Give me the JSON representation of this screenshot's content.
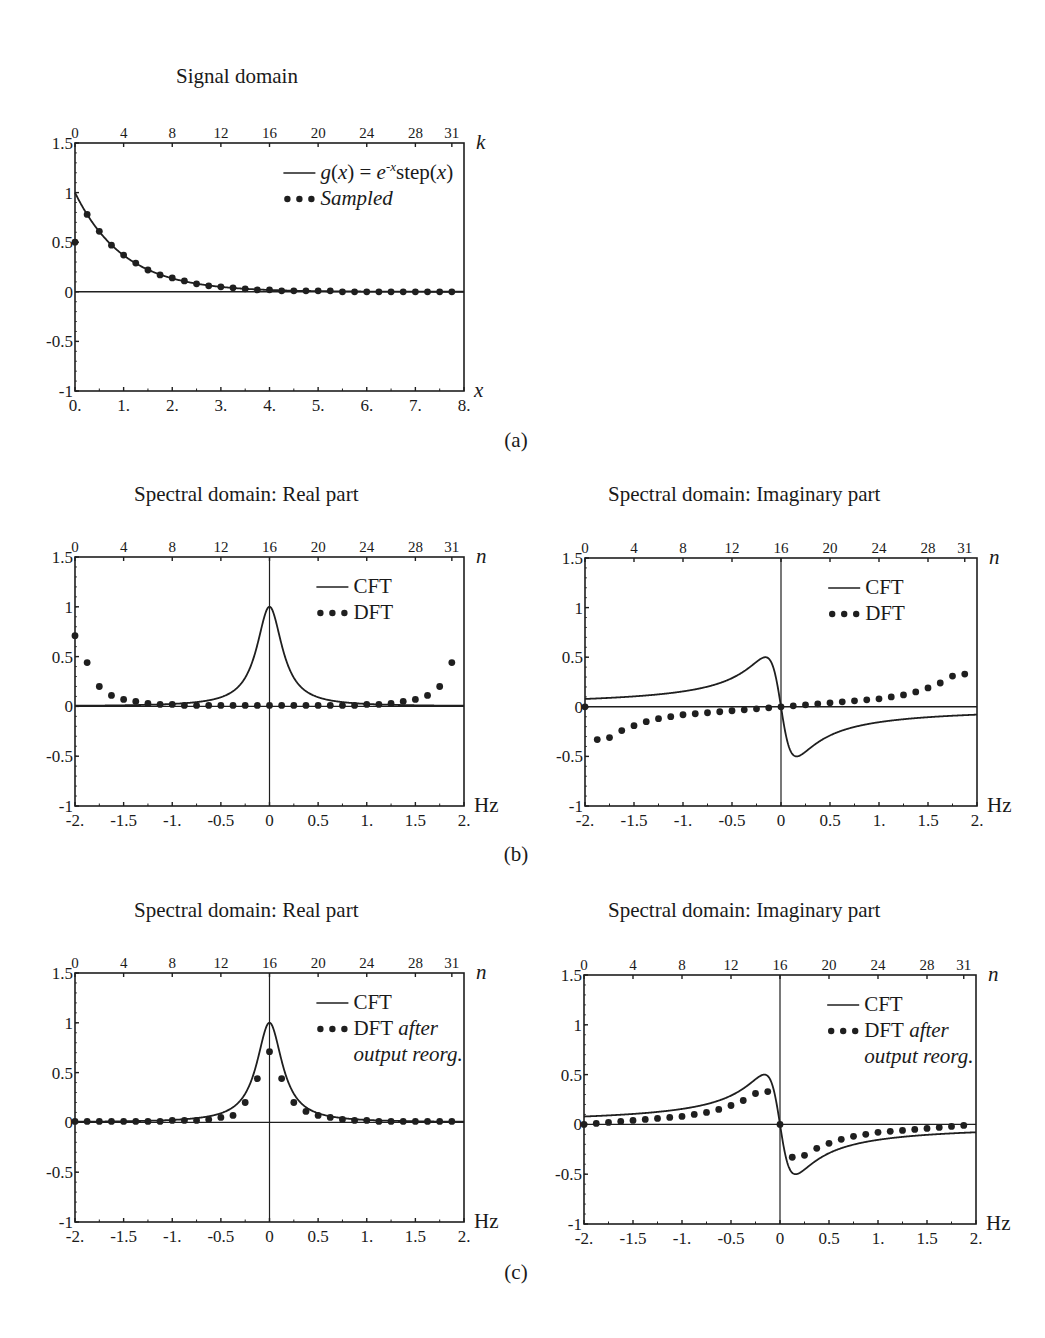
{
  "figure": {
    "panel_labels": {
      "a": "(a)",
      "b": "(b)",
      "c": "(c)"
    }
  },
  "plots": [
    {
      "id": "signal",
      "title": "Signal domain",
      "left": 75,
      "top": 143,
      "width": 389,
      "height": 248,
      "xrange": [
        0,
        8
      ],
      "yrange": [
        -1,
        1.5
      ],
      "bottom_ticks": [
        "0.",
        "1.",
        "2.",
        "3.",
        "4.",
        "5.",
        "6.",
        "7.",
        "8."
      ],
      "bottom_tick_values": [
        0,
        1,
        2,
        3,
        4,
        5,
        6,
        7,
        8
      ],
      "top_ticks": [
        "0",
        "4",
        "8",
        "12",
        "16",
        "20",
        "24",
        "28",
        "31"
      ],
      "top_tick_index": [
        0,
        4,
        8,
        12,
        16,
        20,
        24,
        28,
        31
      ],
      "top_index_to_x": {
        "offset": 0,
        "step": 0.25
      },
      "y_ticks": [
        "1.5",
        "1",
        "0.5",
        "0",
        "-0.5",
        "-1"
      ],
      "y_tick_values": [
        1.5,
        1,
        0.5,
        0,
        -0.5,
        -1
      ],
      "x_axis_label": "x",
      "top_axis_label": "k",
      "center_vline": false,
      "legend": {
        "line": "g(x) = e^{-x} step(x)",
        "line_text": "g(x) = e",
        "line_sup": "-x",
        "line_text2": "step(x)",
        "dots": "Sampled",
        "dots_italic": true,
        "dots_extra": ""
      },
      "curve": "exp"
    },
    {
      "id": "real-b",
      "title": "Spectral domain: Real part",
      "left": 75,
      "top": 557,
      "width": 389,
      "height": 249,
      "xrange": [
        -2,
        2
      ],
      "yrange": [
        -1,
        1.5
      ],
      "bottom_ticks": [
        "-2.",
        "-1.5",
        "-1.",
        "-0.5",
        "0",
        "0.5",
        "1.",
        "1.5",
        "2."
      ],
      "bottom_tick_values": [
        -2,
        -1.5,
        -1,
        -0.5,
        0,
        0.5,
        1,
        1.5,
        2
      ],
      "top_ticks": [
        "0",
        "4",
        "8",
        "12",
        "16",
        "20",
        "24",
        "28",
        "31"
      ],
      "top_tick_index": [
        0,
        4,
        8,
        12,
        16,
        20,
        24,
        28,
        31
      ],
      "top_index_to_x": {
        "offset": -2,
        "step": 0.125
      },
      "y_ticks": [
        "1.5",
        "1",
        "0.5",
        "0",
        "-0.5",
        "-1"
      ],
      "y_tick_values": [
        1.5,
        1,
        0.5,
        0,
        -0.5,
        -1
      ],
      "x_axis_label": "Hz",
      "top_axis_label": "n",
      "center_vline": true,
      "legend": {
        "line_text": "CFT",
        "line_sup": "",
        "line_text2": "",
        "dots": "DFT",
        "dots_italic": false,
        "dots_extra": ""
      },
      "curve": "re"
    },
    {
      "id": "imag-b",
      "title": "Spectral domain: Imaginary part",
      "left": 585,
      "top": 558,
      "width": 392,
      "height": 248,
      "xrange": [
        -2,
        2
      ],
      "yrange": [
        -1,
        1.5
      ],
      "bottom_ticks": [
        "-2.",
        "-1.5",
        "-1.",
        "-0.5",
        "0",
        "0.5",
        "1.",
        "1.5",
        "2."
      ],
      "bottom_tick_values": [
        -2,
        -1.5,
        -1,
        -0.5,
        0,
        0.5,
        1,
        1.5,
        2
      ],
      "top_ticks": [
        "0",
        "4",
        "8",
        "12",
        "16",
        "20",
        "24",
        "28",
        "31"
      ],
      "top_tick_index": [
        0,
        4,
        8,
        12,
        16,
        20,
        24,
        28,
        31
      ],
      "top_index_to_x": {
        "offset": -2,
        "step": 0.125
      },
      "y_ticks": [
        "1.5",
        "1",
        "0.5",
        "0",
        "-0.5",
        "-1"
      ],
      "y_tick_values": [
        1.5,
        1,
        0.5,
        0,
        -0.5,
        -1
      ],
      "x_axis_label": "Hz",
      "top_axis_label": "n",
      "center_vline": true,
      "legend": {
        "line_text": "CFT",
        "line_sup": "",
        "line_text2": "",
        "dots": "DFT",
        "dots_italic": false,
        "dots_extra": ""
      },
      "curve": "im"
    },
    {
      "id": "real-c",
      "title": "Spectral domain: Real part",
      "left": 75,
      "top": 973,
      "width": 389,
      "height": 249,
      "xrange": [
        -2,
        2
      ],
      "yrange": [
        -1,
        1.5
      ],
      "bottom_ticks": [
        "-2.",
        "-1.5",
        "-1.",
        "-0.5",
        "0",
        "0.5",
        "1.",
        "1.5",
        "2."
      ],
      "bottom_tick_values": [
        -2,
        -1.5,
        -1,
        -0.5,
        0,
        0.5,
        1,
        1.5,
        2
      ],
      "top_ticks": [
        "0",
        "4",
        "8",
        "12",
        "16",
        "20",
        "24",
        "28",
        "31"
      ],
      "top_tick_index": [
        0,
        4,
        8,
        12,
        16,
        20,
        24,
        28,
        31
      ],
      "top_index_to_x": {
        "offset": -2,
        "step": 0.125
      },
      "y_ticks": [
        "1.5",
        "1",
        "0.5",
        "0",
        "-0.5",
        "-1"
      ],
      "y_tick_values": [
        1.5,
        1,
        0.5,
        0,
        -0.5,
        -1
      ],
      "x_axis_label": "Hz",
      "top_axis_label": "n",
      "center_vline": true,
      "legend": {
        "line_text": "CFT",
        "line_sup": "",
        "line_text2": "",
        "dots": "DFT",
        "dots_italic": false,
        "dots_extra": "after",
        "dots_extra2": "output reorg."
      },
      "curve": "re"
    },
    {
      "id": "imag-c",
      "title": "Spectral domain: Imaginary part",
      "left": 584,
      "top": 975,
      "width": 392,
      "height": 249,
      "xrange": [
        -2,
        2
      ],
      "yrange": [
        -1,
        1.5
      ],
      "bottom_ticks": [
        "-2.",
        "-1.5",
        "-1.",
        "-0.5",
        "0",
        "0.5",
        "1.",
        "1.5",
        "2."
      ],
      "bottom_tick_values": [
        -2,
        -1.5,
        -1,
        -0.5,
        0,
        0.5,
        1,
        1.5,
        2
      ],
      "top_ticks": [
        "0",
        "4",
        "8",
        "12",
        "16",
        "20",
        "24",
        "28",
        "31"
      ],
      "top_tick_index": [
        0,
        4,
        8,
        12,
        16,
        20,
        24,
        28,
        31
      ],
      "top_index_to_x": {
        "offset": -2,
        "step": 0.125
      },
      "y_ticks": [
        "1.5",
        "1",
        "0.5",
        "0",
        "-0.5",
        "-1"
      ],
      "y_tick_values": [
        1.5,
        1,
        0.5,
        0,
        -0.5,
        -1
      ],
      "x_axis_label": "Hz",
      "top_axis_label": "n",
      "center_vline": true,
      "legend": {
        "line_text": "CFT",
        "line_sup": "",
        "line_text2": "",
        "dots": "DFT",
        "dots_italic": false,
        "dots_extra": "after",
        "dots_extra2": "output reorg."
      },
      "curve": "im"
    }
  ],
  "chart_data": [
    {
      "type": "line",
      "title": "Signal domain",
      "xlabel": "x",
      "top_xlabel": "k",
      "ylabel": "",
      "xlim": [
        0,
        8
      ],
      "ylim": [
        -1,
        1.5
      ],
      "x_ticks": [
        "0.",
        "1.",
        "2.",
        "3.",
        "4.",
        "5.",
        "6.",
        "7.",
        "8."
      ],
      "top_ticks": [
        "0",
        "4",
        "8",
        "12",
        "16",
        "20",
        "24",
        "28",
        "31"
      ],
      "y_ticks": [
        "1.5",
        "1",
        "0.5",
        "0",
        "-0.5",
        "-1"
      ],
      "legend": [
        "g(x) = e^{-x} step(x)",
        "Sampled"
      ],
      "series": [
        {
          "name": "g(x) = e^{-x} step(x)",
          "style": "line",
          "function": "exp(-x) for x>=0"
        },
        {
          "name": "Sampled",
          "style": "dots",
          "x": [
            0,
            0.25,
            0.5,
            0.75,
            1,
            1.25,
            1.5,
            1.75,
            2,
            2.25,
            2.5,
            2.75,
            3,
            3.25,
            3.5,
            3.75,
            4,
            4.25,
            4.5,
            4.75,
            5,
            5.25,
            5.5,
            5.75,
            6,
            6.25,
            6.5,
            6.75,
            7,
            7.25,
            7.5,
            7.75
          ],
          "values": [
            0.5,
            0.78,
            0.61,
            0.47,
            0.37,
            0.29,
            0.22,
            0.17,
            0.14,
            0.11,
            0.08,
            0.06,
            0.05,
            0.04,
            0.03,
            0.02,
            0.02,
            0.01,
            0.01,
            0.01,
            0.01,
            0.01,
            0,
            0,
            0,
            0,
            0,
            0,
            0,
            0,
            0,
            0
          ]
        }
      ],
      "panel": "(a)"
    },
    {
      "type": "line",
      "title": "Spectral domain: Real part",
      "xlabel": "Hz",
      "top_xlabel": "n",
      "xlim": [
        -2,
        2
      ],
      "ylim": [
        -1,
        1.5
      ],
      "x_ticks": [
        "-2.",
        "-1.5",
        "-1.",
        "-0.5",
        "0",
        "0.5",
        "1.",
        "1.5",
        "2."
      ],
      "top_ticks": [
        "0",
        "4",
        "8",
        "12",
        "16",
        "20",
        "24",
        "28",
        "31"
      ],
      "y_ticks": [
        "1.5",
        "1",
        "0.5",
        "0",
        "-0.5",
        "-1"
      ],
      "legend": [
        "CFT",
        "DFT"
      ],
      "series": [
        {
          "name": "CFT",
          "style": "line",
          "function": "1/(1+(2*pi*f)^2)"
        },
        {
          "name": "DFT",
          "style": "dots",
          "x": [
            -2,
            -1.875,
            -1.75,
            -1.625,
            -1.5,
            -1.375,
            -1.25,
            -1.125,
            -1,
            -0.875,
            -0.75,
            -0.625,
            -0.5,
            -0.375,
            -0.25,
            -0.125,
            0,
            0.125,
            0.25,
            0.375,
            0.5,
            0.625,
            0.75,
            0.875,
            1,
            1.125,
            1.25,
            1.375,
            1.5,
            1.625,
            1.75,
            1.875
          ],
          "values": [
            0.71,
            0.44,
            0.2,
            0.11,
            0.07,
            0.05,
            0.03,
            0.02,
            0.02,
            0.01,
            0.01,
            0.01,
            0.01,
            0.01,
            0.01,
            0.01,
            0.01,
            0.01,
            0.01,
            0.01,
            0.01,
            0.01,
            0.01,
            0.01,
            0.02,
            0.02,
            0.03,
            0.05,
            0.07,
            0.11,
            0.2,
            0.44
          ]
        }
      ],
      "panel": "(b)"
    },
    {
      "type": "line",
      "title": "Spectral domain: Imaginary part",
      "xlabel": "Hz",
      "top_xlabel": "n",
      "xlim": [
        -2,
        2
      ],
      "ylim": [
        -1,
        1.5
      ],
      "x_ticks": [
        "-2.",
        "-1.5",
        "-1.",
        "-0.5",
        "0",
        "0.5",
        "1.",
        "1.5",
        "2."
      ],
      "top_ticks": [
        "0",
        "4",
        "8",
        "12",
        "16",
        "20",
        "24",
        "28",
        "31"
      ],
      "y_ticks": [
        "1.5",
        "1",
        "0.5",
        "0",
        "-0.5",
        "-1"
      ],
      "legend": [
        "CFT",
        "DFT"
      ],
      "series": [
        {
          "name": "CFT",
          "style": "line",
          "function": "-2*pi*f/(1+(2*pi*f)^2)"
        },
        {
          "name": "DFT",
          "style": "dots",
          "x": [
            -2,
            -1.875,
            -1.75,
            -1.625,
            -1.5,
            -1.375,
            -1.25,
            -1.125,
            -1,
            -0.875,
            -0.75,
            -0.625,
            -0.5,
            -0.375,
            -0.25,
            -0.125,
            0,
            0.125,
            0.25,
            0.375,
            0.5,
            0.625,
            0.75,
            0.875,
            1,
            1.125,
            1.25,
            1.375,
            1.5,
            1.625,
            1.75,
            1.875
          ],
          "values": [
            0,
            -0.33,
            -0.31,
            -0.24,
            -0.19,
            -0.15,
            -0.12,
            -0.1,
            -0.08,
            -0.07,
            -0.06,
            -0.05,
            -0.04,
            -0.03,
            -0.02,
            -0.01,
            0,
            0.01,
            0.02,
            0.03,
            0.04,
            0.05,
            0.06,
            0.07,
            0.08,
            0.1,
            0.12,
            0.15,
            0.19,
            0.24,
            0.31,
            0.33
          ]
        }
      ],
      "panel": "(b)"
    },
    {
      "type": "line",
      "title": "Spectral domain: Real part",
      "xlabel": "Hz",
      "top_xlabel": "n",
      "xlim": [
        -2,
        2
      ],
      "ylim": [
        -1,
        1.5
      ],
      "x_ticks": [
        "-2.",
        "-1.5",
        "-1.",
        "-0.5",
        "0",
        "0.5",
        "1.",
        "1.5",
        "2."
      ],
      "top_ticks": [
        "0",
        "4",
        "8",
        "12",
        "16",
        "20",
        "24",
        "28",
        "31"
      ],
      "y_ticks": [
        "1.5",
        "1",
        "0.5",
        "0",
        "-0.5",
        "-1"
      ],
      "legend": [
        "CFT",
        "DFT after output reorg."
      ],
      "series": [
        {
          "name": "CFT",
          "style": "line",
          "function": "1/(1+(2*pi*f)^2)"
        },
        {
          "name": "DFT after output reorg.",
          "style": "dots",
          "x": [
            -2,
            -1.875,
            -1.75,
            -1.625,
            -1.5,
            -1.375,
            -1.25,
            -1.125,
            -1,
            -0.875,
            -0.75,
            -0.625,
            -0.5,
            -0.375,
            -0.25,
            -0.125,
            0,
            0.125,
            0.25,
            0.375,
            0.5,
            0.625,
            0.75,
            0.875,
            1,
            1.125,
            1.25,
            1.375,
            1.5,
            1.625,
            1.75,
            1.875
          ],
          "values": [
            0.01,
            0.01,
            0.01,
            0.01,
            0.01,
            0.01,
            0.01,
            0.01,
            0.02,
            0.02,
            0.02,
            0.03,
            0.05,
            0.07,
            0.2,
            0.44,
            0.71,
            0.44,
            0.2,
            0.11,
            0.07,
            0.05,
            0.03,
            0.02,
            0.02,
            0.01,
            0.01,
            0.01,
            0.01,
            0.01,
            0.01,
            0.01
          ]
        }
      ],
      "panel": "(c)"
    },
    {
      "type": "line",
      "title": "Spectral domain: Imaginary part",
      "xlabel": "Hz",
      "top_xlabel": "n",
      "xlim": [
        -2,
        2
      ],
      "ylim": [
        -1,
        1.5
      ],
      "x_ticks": [
        "-2.",
        "-1.5",
        "-1.",
        "-0.5",
        "0",
        "0.5",
        "1.",
        "1.5",
        "2."
      ],
      "top_ticks": [
        "0",
        "4",
        "8",
        "12",
        "16",
        "20",
        "24",
        "28",
        "31"
      ],
      "y_ticks": [
        "1.5",
        "1",
        "0.5",
        "0",
        "-0.5",
        "-1"
      ],
      "legend": [
        "CFT",
        "DFT after output reorg."
      ],
      "series": [
        {
          "name": "CFT",
          "style": "line",
          "function": "-2*pi*f/(1+(2*pi*f)^2)"
        },
        {
          "name": "DFT after output reorg.",
          "style": "dots",
          "x": [
            -2,
            -1.875,
            -1.75,
            -1.625,
            -1.5,
            -1.375,
            -1.25,
            -1.125,
            -1,
            -0.875,
            -0.75,
            -0.625,
            -0.5,
            -0.375,
            -0.25,
            -0.125,
            0,
            0.125,
            0.25,
            0.375,
            0.5,
            0.625,
            0.75,
            0.875,
            1,
            1.125,
            1.25,
            1.375,
            1.5,
            1.625,
            1.75,
            1.875
          ],
          "values": [
            0,
            0.01,
            0.02,
            0.03,
            0.04,
            0.05,
            0.06,
            0.07,
            0.08,
            0.1,
            0.12,
            0.15,
            0.19,
            0.24,
            0.31,
            0.33,
            0,
            -0.33,
            -0.31,
            -0.24,
            -0.19,
            -0.15,
            -0.12,
            -0.1,
            -0.08,
            -0.07,
            -0.06,
            -0.05,
            -0.04,
            -0.03,
            -0.02,
            -0.01
          ]
        }
      ],
      "panel": "(c)"
    }
  ]
}
